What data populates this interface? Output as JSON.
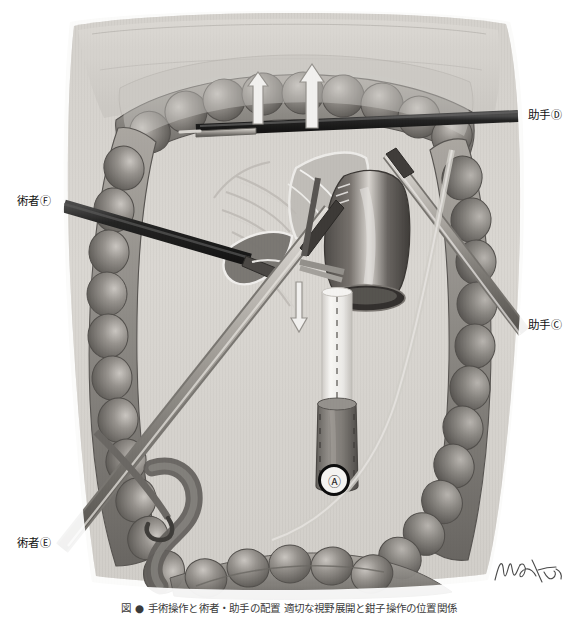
{
  "figure": {
    "caption": "図 ● 手術操作と術者・助手の配置 適切な視野展開と鉗子操作の位置関係",
    "signature_alt": "artist-signature"
  },
  "callouts": [
    {
      "id": "operator-f",
      "text": "術者",
      "marker": "Ⓕ",
      "role": "operator",
      "side": "left"
    },
    {
      "id": "operator-e",
      "text": "術者",
      "marker": "Ⓔ",
      "role": "operator",
      "side": "left"
    },
    {
      "id": "assistant-d",
      "text": "助手",
      "marker": "Ⓓ",
      "role": "assistant",
      "side": "right"
    },
    {
      "id": "assistant-c",
      "text": "助手",
      "marker": "Ⓒ",
      "role": "assistant",
      "side": "right"
    }
  ],
  "markers": {
    "port_a": "Ⓐ"
  },
  "arrows": [
    {
      "id": "traction-arrow-left",
      "direction": "up",
      "label": ""
    },
    {
      "id": "traction-arrow-right",
      "direction": "up",
      "label": ""
    },
    {
      "id": "traction-arrow-down",
      "direction": "down",
      "label": ""
    }
  ],
  "colors": {
    "background": "#ffffff",
    "bowel_dark": "#6f6c68",
    "bowel_mid": "#8e8b86",
    "bowel_light": "#b6b2ad",
    "peritoneum": "#cbc8c3",
    "field_light": "#d6d3ce",
    "instrument_black": "#121212",
    "instrument_steel": "#9a9790",
    "stump_dark": "#4a4744",
    "anvil_white": "#f2f1ee",
    "outline": "#3c3a37",
    "label_text": "#111111",
    "caption_text": "#3a3a3a"
  }
}
